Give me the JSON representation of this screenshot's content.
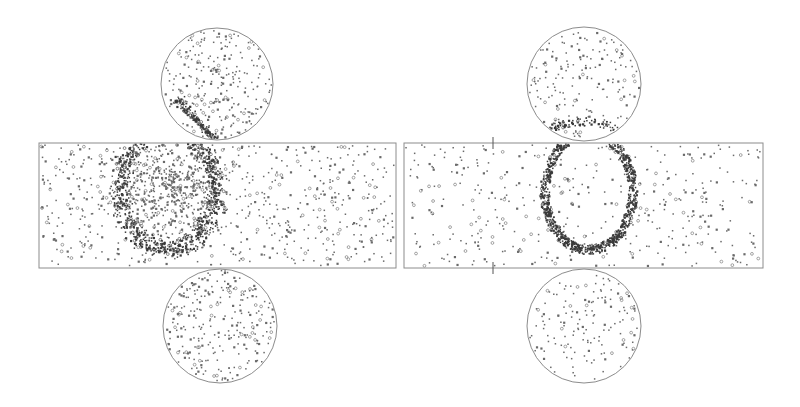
{
  "figure": {
    "type": "event-display",
    "width": 800,
    "height": 407,
    "background": "#ffffff",
    "outline_color": "#8c8c8c",
    "hit_color": "#6a6a6a",
    "hit_dark_color": "#3a3a3a"
  },
  "panels": [
    {
      "name": "left-event",
      "barrel": {
        "x": 39,
        "y": 143,
        "w": 357,
        "h": 125
      },
      "top_cap": {
        "cx": 217,
        "cy": 84,
        "r": 56
      },
      "bottom_cap": {
        "cx": 220,
        "cy": 326,
        "r": 57
      },
      "ring": {
        "cx": 168,
        "cy": 190,
        "rx": 48,
        "ry": 58,
        "thickness": 14,
        "density": 900,
        "fuzzy": true
      },
      "background_hits": 650,
      "cap_top_hits": 260,
      "cap_bottom_hits": 260,
      "top_cap_streak": {
        "x1": 178,
        "y1": 100,
        "x2": 215,
        "y2": 140,
        "count": 140
      },
      "markers": []
    },
    {
      "name": "right-event",
      "barrel": {
        "x": 404,
        "y": 143,
        "w": 359,
        "h": 125
      },
      "top_cap": {
        "cx": 584,
        "cy": 84,
        "r": 57
      },
      "bottom_cap": {
        "cx": 584,
        "cy": 326,
        "r": 57
      },
      "ring": {
        "cx": 589,
        "cy": 192,
        "rx": 44,
        "ry": 58,
        "thickness": 9,
        "density": 1000,
        "fuzzy": false
      },
      "background_hits": 420,
      "cap_top_hits": 170,
      "cap_bottom_hits": 150,
      "top_cap_arc": {
        "cx": 584,
        "cy": 152,
        "rx": 50,
        "ry": 30,
        "count": 160
      },
      "markers": [
        {
          "x": 493,
          "y": 143
        },
        {
          "x": 493,
          "y": 268
        }
      ]
    }
  ]
}
